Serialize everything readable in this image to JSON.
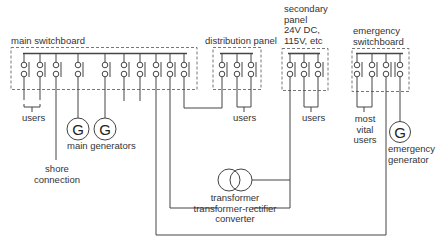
{
  "diagram": {
    "panels": {
      "main_switchboard": {
        "label": "main switchboard"
      },
      "distribution_panel": {
        "label": "distribution panel"
      },
      "secondary_panel": {
        "label_lines": [
          "secondary",
          "panel",
          "24V DC,",
          "115V, etc"
        ]
      },
      "emergency_switchboard": {
        "label_lines": [
          "emergency",
          "switchboard"
        ]
      }
    },
    "labels": {
      "users_main": "users",
      "users_distribution": "users",
      "users_secondary": "users",
      "most_vital_users": [
        "most",
        "vital",
        "users"
      ],
      "shore_connection": [
        "shore",
        "connection"
      ],
      "main_generators": "main generators",
      "emergency_generator": [
        "emergency",
        "generator"
      ],
      "transformer": [
        "transformer",
        "transformer-rectifier",
        "converter"
      ]
    },
    "generator_symbol": "G",
    "colors": {
      "line": "#444444",
      "dash": "#666666",
      "text": "#333333"
    }
  }
}
